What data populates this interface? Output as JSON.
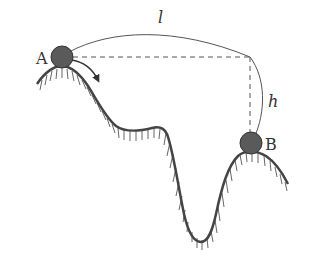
{
  "diagram": {
    "title": "",
    "labels": {
      "point_a": "A",
      "point_b": "B",
      "length": "l",
      "height": "h"
    },
    "elements": {
      "ball_a": {
        "label": "A",
        "color": "#5a5a5a"
      },
      "ball_b": {
        "label": "B",
        "color": "#5a5a5a"
      },
      "arrow": {
        "description": "direction of motion from A down slope"
      },
      "ground": {
        "description": "hatched wavy terrain with peaks at A and B and deep valley between"
      },
      "dashed_horizontal": {
        "description": "horizontal reference from A"
      },
      "dashed_vertical": {
        "description": "vertical drop to B"
      },
      "arc_l": {
        "label": "l"
      },
      "arc_h": {
        "label": "h"
      }
    },
    "colors": {
      "line": "#444444",
      "ball_fill": "#5a5a5a",
      "hatch": "#555555",
      "text": "#333333"
    }
  }
}
